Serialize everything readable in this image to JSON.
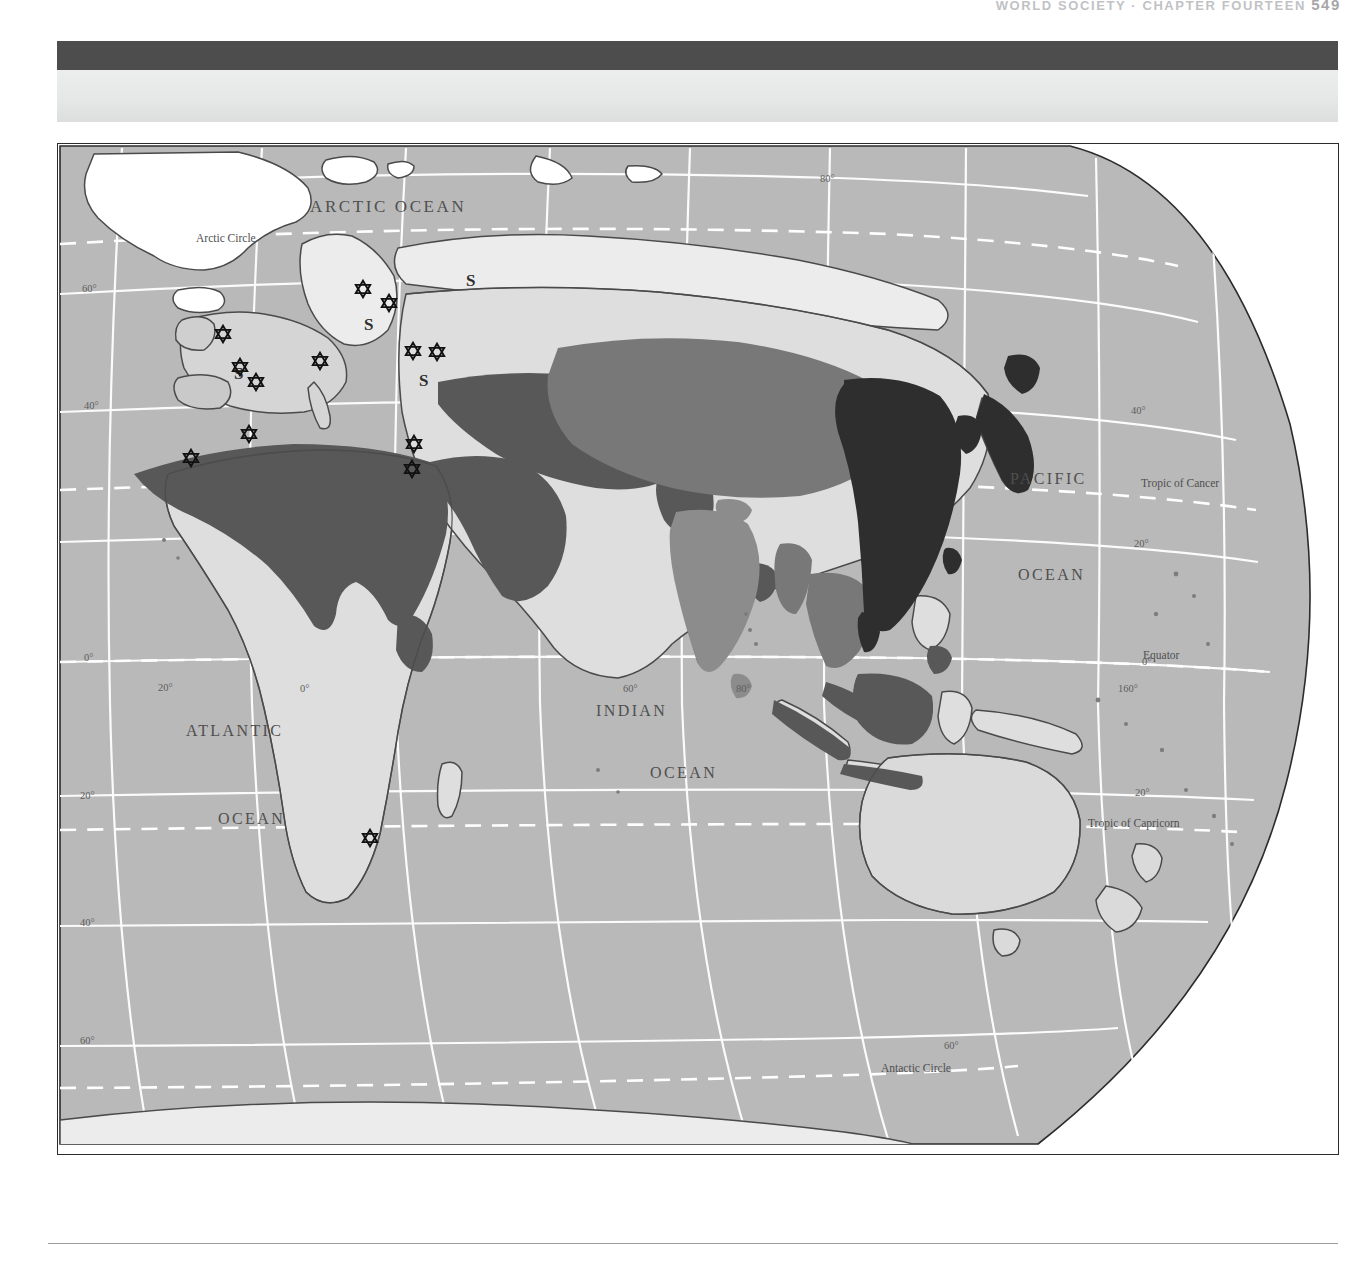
{
  "page": {
    "running_head": "WORLD SOCIETY  ·  CHAPTER FOURTEEN",
    "folio": "549"
  },
  "map": {
    "title": "World Distribution of Major Religions",
    "projection": "oblique-globe-eastern-hemisphere",
    "colors": {
      "ocean": "#b9b9b9",
      "land_light": "#d8d8d8",
      "land_pale": "#e6e6e6",
      "region_islam": "#585858",
      "region_hinduism": "#8e8e8e",
      "region_buddhism": "#6f6f6f",
      "region_east_asian": "#2c2c2c",
      "graticule": "#ffffff",
      "coast": "#4a4a4a",
      "label": "#4f4f4f",
      "frame": "#2c2c2c",
      "banner_dark": "#4d4d4d",
      "banner_light": "#e6e7e7"
    },
    "ocean_labels": [
      {
        "name": "arctic-ocean",
        "text": "ARCTIC   OCEAN",
        "x": 252,
        "y": 68,
        "size": 17,
        "spacing": 2.4
      },
      {
        "name": "atlantic-ocean-line1",
        "text": "ATLANTIC",
        "x": 128,
        "y": 592,
        "size": 16,
        "spacing": 2.2
      },
      {
        "name": "atlantic-ocean-line2",
        "text": "OCEAN",
        "x": 160,
        "y": 680,
        "size": 16,
        "spacing": 2.2
      },
      {
        "name": "indian-ocean-line1",
        "text": "INDIAN",
        "x": 538,
        "y": 572,
        "size": 16,
        "spacing": 2.2
      },
      {
        "name": "indian-ocean-line2",
        "text": "OCEAN",
        "x": 592,
        "y": 634,
        "size": 16,
        "spacing": 2.2
      },
      {
        "name": "pacific-ocean-line1",
        "text": "PACIFIC",
        "x": 952,
        "y": 340,
        "size": 16,
        "spacing": 2.2
      },
      {
        "name": "pacific-ocean-line2",
        "text": "OCEAN",
        "x": 960,
        "y": 436,
        "size": 16,
        "spacing": 2.2
      }
    ],
    "reference_lines": [
      {
        "name": "arctic-circle",
        "text": "Arctic Circle",
        "x": 138,
        "y": 98,
        "size": 11
      },
      {
        "name": "tropic-of-cancer",
        "text": "Tropic of Cancer",
        "x": 1083,
        "y": 343,
        "size": 11
      },
      {
        "name": "equator",
        "text": "Equator",
        "x": 1085,
        "y": 518,
        "size": 11
      },
      {
        "name": "tropic-of-capricorn",
        "text": "Tropic of Capricorn",
        "x": 1030,
        "y": 685,
        "size": 11
      },
      {
        "name": "antarctic-circle",
        "text": "Antactic Circle",
        "x": 823,
        "y": 928,
        "size": 11
      }
    ],
    "graticule_labels": [
      {
        "name": "lat-60n-west",
        "text": "60°",
        "x": 24,
        "y": 148
      },
      {
        "name": "lat-40n-west",
        "text": "40°",
        "x": 26,
        "y": 265
      },
      {
        "name": "lat-0-west",
        "text": "0°",
        "x": 26,
        "y": 517
      },
      {
        "name": "lat-20s-west",
        "text": "20°",
        "x": 22,
        "y": 655
      },
      {
        "name": "lat-40s-west",
        "text": "40°",
        "x": 22,
        "y": 782
      },
      {
        "name": "lat-60s-west",
        "text": "60°",
        "x": 22,
        "y": 900
      },
      {
        "name": "lat-80n-top",
        "text": "80°",
        "x": 762,
        "y": 38
      },
      {
        "name": "lat-40n-east",
        "text": "40°",
        "x": 1073,
        "y": 270
      },
      {
        "name": "lat-20n-east",
        "text": "20°",
        "x": 1076,
        "y": 403
      },
      {
        "name": "lat-0-east",
        "text": "0°",
        "x": 1084,
        "y": 521
      },
      {
        "name": "lat-20s-east",
        "text": "20°",
        "x": 1077,
        "y": 652
      },
      {
        "name": "lat-60s-east",
        "text": "60°",
        "x": 886,
        "y": 905
      },
      {
        "name": "lon-20w",
        "text": "20°",
        "x": 100,
        "y": 547
      },
      {
        "name": "lon-0",
        "text": "0°",
        "x": 242,
        "y": 548
      },
      {
        "name": "lon-60e",
        "text": "60°",
        "x": 565,
        "y": 548
      },
      {
        "name": "lon-80e",
        "text": "80°",
        "x": 678,
        "y": 548
      },
      {
        "name": "lon-160e",
        "text": "160°",
        "x": 1060,
        "y": 548
      }
    ],
    "sect_markers": [
      {
        "name": "s-label-siberia",
        "text": "S",
        "x": 408,
        "y": 142
      },
      {
        "name": "s-label-baltic",
        "text": "S",
        "x": 306,
        "y": 186
      },
      {
        "name": "s-label-west-russia",
        "text": "S",
        "x": 361,
        "y": 242
      },
      {
        "name": "s-label-iberia",
        "text": "S",
        "x": 176,
        "y": 235
      }
    ],
    "star_markers": [
      {
        "name": "star-britain",
        "x": 165,
        "y": 190
      },
      {
        "name": "star-france",
        "x": 182,
        "y": 223
      },
      {
        "name": "star-spain",
        "x": 196,
        "y": 238
      },
      {
        "name": "star-germany",
        "x": 262,
        "y": 217
      },
      {
        "name": "star-finland",
        "x": 305,
        "y": 145
      },
      {
        "name": "star-belarus",
        "x": 330,
        "y": 159
      },
      {
        "name": "star-ukraine",
        "x": 355,
        "y": 207
      },
      {
        "name": "star-south-russia",
        "x": 378,
        "y": 208
      },
      {
        "name": "star-morocco",
        "x": 133,
        "y": 314
      },
      {
        "name": "star-algeria",
        "x": 191,
        "y": 290
      },
      {
        "name": "star-israel-north",
        "x": 356,
        "y": 300
      },
      {
        "name": "star-israel-south",
        "x": 354,
        "y": 325
      },
      {
        "name": "star-south-africa",
        "x": 312,
        "y": 694
      }
    ]
  }
}
